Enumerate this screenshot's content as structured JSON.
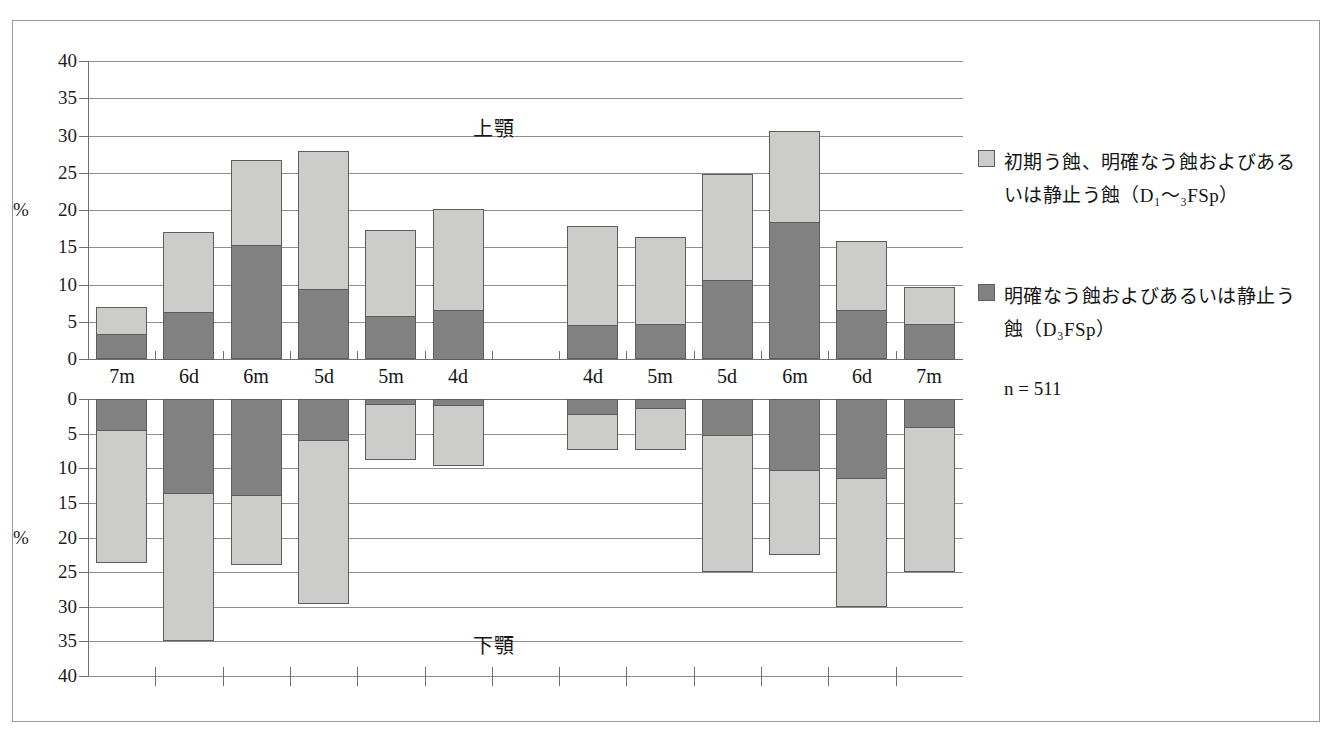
{
  "figure": {
    "upper_panel_caption": "上顎",
    "lower_panel_caption": "下顎",
    "y_axis_unit": "%",
    "sample_note": "n = 511"
  },
  "legend": {
    "items": [
      {
        "swatch": "light-gray",
        "color": "#cccccb",
        "label": "初期う蝕、明確なう蝕およびあるいは静止う蝕（D₁〜₃FSp）"
      },
      {
        "swatch": "dark-gray",
        "color": "#818181",
        "label": "明確なう蝕およびあるいは静止う蝕（D₃FSp）"
      }
    ]
  },
  "chart_data": {
    "type": "bar",
    "title": "",
    "subtitle": "",
    "xlabel": "",
    "ylabel": "%",
    "grid": true,
    "legend_position": "right",
    "panels": [
      {
        "name": "upper",
        "caption": "上顎",
        "ylim": [
          0,
          40
        ],
        "yticks": [
          0,
          5,
          10,
          15,
          20,
          25,
          30,
          35,
          40
        ],
        "ytick_labels": [
          "0",
          "5",
          "10",
          "15",
          "20",
          "25",
          "30",
          "35",
          "40"
        ],
        "direction": "up",
        "categories": [
          "7m",
          "6d",
          "6m",
          "5d",
          "5m",
          "4d",
          "",
          "4d",
          "5m",
          "5d",
          "6m",
          "6d",
          "7m"
        ],
        "series": [
          {
            "name": "明確なう蝕およびあるいは静止う蝕（D₃FSp）",
            "color": "#818181",
            "values": [
              3.4,
              6.4,
              15.3,
              9.4,
              5.8,
              6.7,
              null,
              4.6,
              4.7,
              10.6,
              18.4,
              6.6,
              4.8
            ]
          },
          {
            "name": "初期う蝕、明確なう蝕およびあるいは静止う蝕（D₁〜₃FSp）",
            "color": "#cccccb",
            "values": [
              7.0,
              17.1,
              26.7,
              27.9,
              17.3,
              20.2,
              null,
              17.9,
              16.4,
              24.8,
              30.6,
              15.9,
              9.7
            ]
          }
        ]
      },
      {
        "name": "lower",
        "caption": "下顎",
        "ylim": [
          0,
          40
        ],
        "yticks": [
          0,
          5,
          10,
          15,
          20,
          25,
          30,
          35,
          40
        ],
        "ytick_labels": [
          "0",
          "5",
          "10",
          "15",
          "20",
          "25",
          "30",
          "35",
          "40"
        ],
        "direction": "down",
        "categories": [
          "7m",
          "6d",
          "6m",
          "5d",
          "5m",
          "4d",
          "",
          "4d",
          "5m",
          "5d",
          "6m",
          "6d",
          "7m"
        ],
        "series": [
          {
            "name": "明確なう蝕およびあるいは静止う蝕（D₃FSp）",
            "color": "#818181",
            "values": [
              4.6,
              13.7,
              14.0,
              6.1,
              0.8,
              1.0,
              null,
              2.3,
              1.4,
              5.4,
              10.4,
              11.5,
              4.2
            ]
          },
          {
            "name": "初期う蝕、明確なう蝕およびあるいは静止う蝕（D₁〜₃FSp）",
            "color": "#cccccb",
            "values": [
              23.6,
              34.9,
              23.9,
              29.6,
              8.8,
              9.6,
              null,
              7.4,
              7.3,
              25.0,
              22.5,
              30.0,
              25.0
            ]
          }
        ]
      }
    ]
  }
}
